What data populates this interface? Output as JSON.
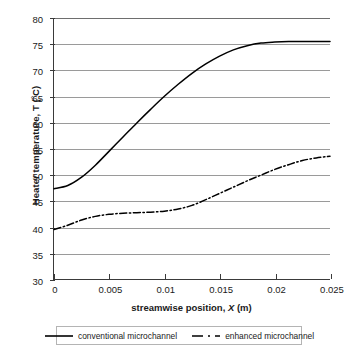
{
  "chart_data": {
    "type": "line",
    "title": "",
    "xlabel": "streamwise position, X (m)",
    "ylabel": "Heater temperature, T (°C)",
    "xlim": [
      0,
      0.025
    ],
    "ylim": [
      30,
      80
    ],
    "grid": true,
    "legend_position": "bottom",
    "x_ticks": [
      "0",
      "0.005",
      "0.01",
      "0.015",
      "0.02",
      "0.025"
    ],
    "x_tick_values": [
      0,
      0.005,
      0.01,
      0.015,
      0.02,
      0.025
    ],
    "y_ticks": [
      "30",
      "35",
      "40",
      "45",
      "50",
      "55",
      "60",
      "65",
      "70",
      "75",
      "80"
    ],
    "y_tick_values": [
      30,
      35,
      40,
      45,
      50,
      55,
      60,
      65,
      70,
      75,
      80
    ],
    "x": [
      0,
      0.00125,
      0.0025,
      0.00375,
      0.005,
      0.00625,
      0.0075,
      0.00875,
      0.01,
      0.01125,
      0.0125,
      0.01375,
      0.015,
      0.01625,
      0.0175,
      0.01875,
      0.02,
      0.02125,
      0.0225,
      0.02375,
      0.025
    ],
    "series": [
      {
        "name": "conventional microchannel",
        "style": "solid",
        "color": "#000000",
        "values": [
          47.3,
          47.9,
          49.5,
          51.8,
          54.5,
          57.2,
          59.9,
          62.5,
          65.0,
          67.3,
          69.4,
          71.2,
          72.7,
          73.9,
          74.7,
          75.2,
          75.4,
          75.5,
          75.5,
          75.5,
          75.5
        ]
      },
      {
        "name": "enhanced microchannel",
        "style": "dash-dot",
        "color": "#000000",
        "values": [
          39.5,
          40.3,
          41.3,
          42.0,
          42.4,
          42.6,
          42.7,
          42.8,
          43.0,
          43.4,
          44.1,
          45.2,
          46.4,
          47.6,
          48.8,
          49.9,
          51.0,
          51.9,
          52.7,
          53.2,
          53.5
        ]
      }
    ],
    "legend": [
      {
        "label": "conventional microchannel",
        "style": "solid"
      },
      {
        "label": "enhanced microchannel",
        "style": "dash-dot"
      }
    ]
  }
}
